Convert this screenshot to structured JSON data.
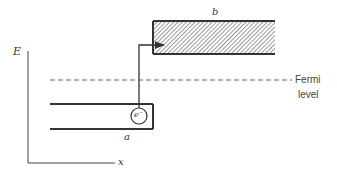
{
  "diagram": {
    "axes": {
      "y_label": "E",
      "x_label": "x"
    },
    "bands": {
      "a": {
        "label": "a",
        "fill": "none"
      },
      "b": {
        "label": "b",
        "fill": "hatched"
      }
    },
    "electron": {
      "label": "e⁻"
    },
    "fermi_level": {
      "line1": "Fermi",
      "line2": "level"
    },
    "colors": {
      "line": "#333333",
      "dash": "#666666",
      "hatch": "#555555"
    }
  }
}
